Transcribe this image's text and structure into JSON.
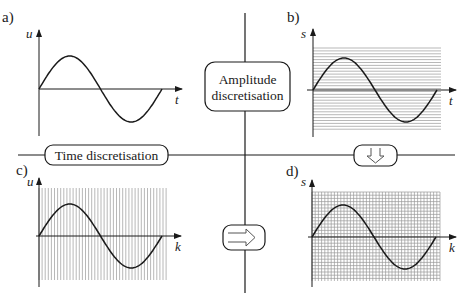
{
  "diagram": {
    "panels": [
      {
        "id": "a",
        "label": "a)",
        "y_axis": "u",
        "x_axis": "t",
        "grid": "none",
        "description": "continuous-time, continuous-amplitude signal"
      },
      {
        "id": "b",
        "label": "b)",
        "y_axis": "s",
        "x_axis": "t",
        "grid": "horizontal",
        "description": "amplitude-discretised signal"
      },
      {
        "id": "c",
        "label": "c)",
        "y_axis": "u",
        "x_axis": "k",
        "grid": "vertical",
        "description": "time-discretised signal"
      },
      {
        "id": "d",
        "label": "d)",
        "y_axis": "s",
        "x_axis": "k",
        "grid": "both",
        "description": "time- and amplitude-discretised (digital) signal"
      }
    ],
    "boxes": {
      "amplitude": {
        "line1": "Amplitude",
        "line2": "discretisation"
      },
      "time": {
        "label": "Time discretisation"
      },
      "down_arrow": {
        "glyph": "⇩",
        "icon": "down-arrow-icon"
      },
      "right_arrow": {
        "glyph": "⇨",
        "icon": "right-arrow-icon"
      }
    },
    "signal": {
      "shape": "sine",
      "periods": 1
    },
    "colors": {
      "ink": "#1a1a1a",
      "grid": "#9a9a9a",
      "background": "#ffffff"
    }
  }
}
